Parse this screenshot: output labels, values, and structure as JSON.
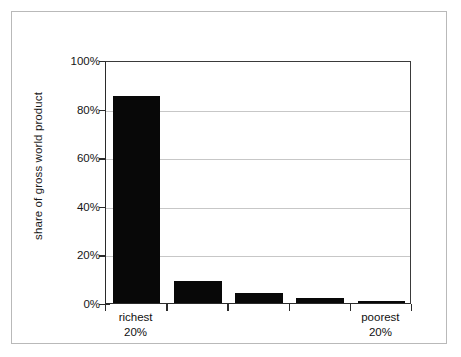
{
  "chart_data": {
    "type": "bar",
    "title": "",
    "subtitle": "",
    "xlabel": "",
    "ylabel": "share of gross world product",
    "ylim": [
      0,
      100
    ],
    "yticks": [
      "0%",
      "20%",
      "40%",
      "60%",
      "80%",
      "100%"
    ],
    "ytick_values": [
      0,
      20,
      40,
      60,
      80,
      100
    ],
    "grid": "horizontal",
    "legend": "none",
    "bar_color": "#080808",
    "gridline_color": "#c7c7c7",
    "axis_color": "#2b2b2b",
    "frame_color": "#b9b9b9",
    "categories": [
      "richest 20%",
      "",
      "",
      "",
      "poorest 20%"
    ],
    "category_labels": [
      {
        "line1": "richest",
        "line2": "20%"
      },
      {
        "line1": "",
        "line2": ""
      },
      {
        "line1": "",
        "line2": ""
      },
      {
        "line1": "",
        "line2": ""
      },
      {
        "line1": "poorest",
        "line2": "20%"
      }
    ],
    "values": [
      85,
      9,
      4,
      2,
      1
    ],
    "units": "percent"
  }
}
